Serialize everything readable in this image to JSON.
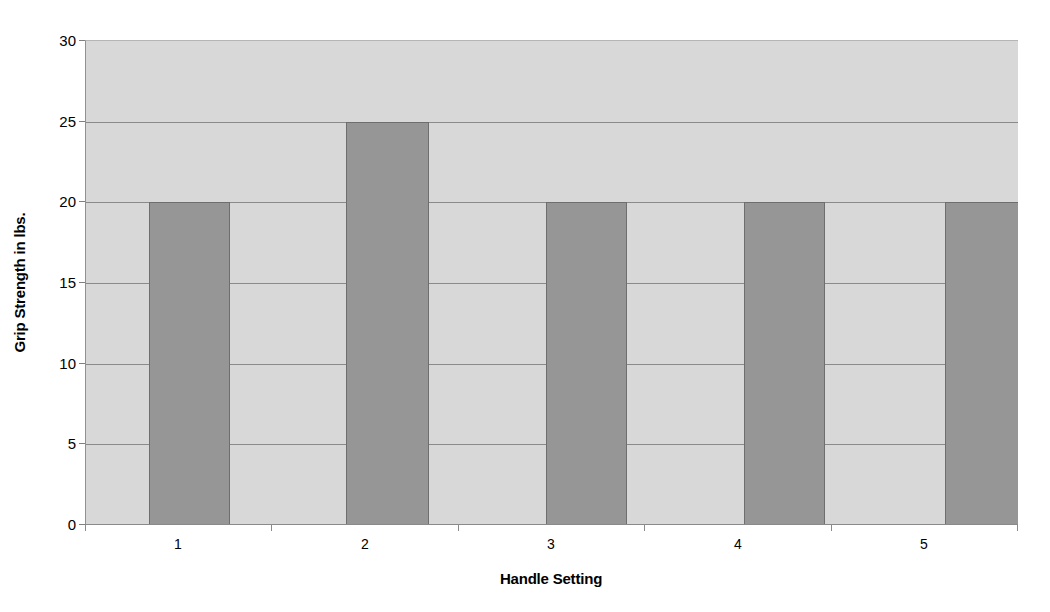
{
  "chart_data": {
    "type": "bar",
    "title": "",
    "categories": [
      "1",
      "2",
      "3",
      "4",
      "5"
    ],
    "values": [
      20,
      25,
      20,
      20,
      20
    ],
    "series": [
      {
        "name": "Grip Strength",
        "values": [
          20,
          25,
          20,
          20,
          20
        ]
      }
    ],
    "xlabel": "Handle Setting",
    "ylabel": "Grip Strength in lbs.",
    "ylim": [
      0,
      30
    ],
    "ytick_labels": [
      "0",
      "5",
      "10",
      "15",
      "20",
      "25",
      "30"
    ],
    "ytick_values": [
      0,
      5,
      10,
      15,
      20,
      25,
      30
    ],
    "grid": true,
    "legend": "none",
    "colors": {
      "bar_fill": "#969696",
      "bar_border": "#6e6e6e",
      "plot_background": "#d8d8d8",
      "gridline": "#8a8a8a",
      "axis": "#8a8a8a",
      "page_background": "#ffffff",
      "text": "#000000"
    }
  }
}
